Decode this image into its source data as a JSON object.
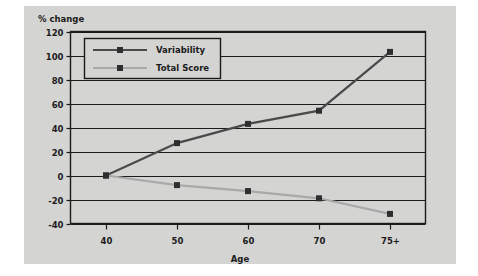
{
  "figure": {
    "background_color": "#ffffff",
    "plate_color": "#d4d4d2",
    "frame_color": "#1b1b1b"
  },
  "axis_titles": {
    "y": "% change",
    "x": "Age"
  },
  "legend": {
    "position": "top-left-inside",
    "entries": [
      {
        "label": "Variability",
        "color": "#4a4a4a",
        "marker": "square"
      },
      {
        "label": "Total Score",
        "color": "#a9a9a9",
        "marker": "square"
      }
    ]
  },
  "chart_data": {
    "type": "line",
    "title": "",
    "subtitle": "",
    "xlabel": "Age",
    "ylabel": "% change",
    "categories": [
      "40",
      "50",
      "60",
      "70",
      "75+"
    ],
    "x_tick_labels": [
      "40",
      "50",
      "60",
      "70",
      "75+"
    ],
    "y_tick_labels": [
      "120",
      "100",
      "80",
      "60",
      "40",
      "20",
      "0",
      "-20",
      "-40"
    ],
    "y_ticks": [
      120,
      100,
      80,
      60,
      40,
      20,
      0,
      -20,
      -40
    ],
    "ylim": [
      -40,
      120
    ],
    "grid": "horizontal",
    "legend_position": "top-left-inside",
    "series": [
      {
        "name": "Variability",
        "color": "#4a4a4a",
        "marker": "square",
        "values": [
          0,
          27,
          43,
          54,
          103
        ]
      },
      {
        "name": "Total Score",
        "color": "#a9a9a9",
        "marker": "square",
        "values": [
          0,
          -8,
          -13,
          -19,
          -32
        ]
      }
    ]
  }
}
